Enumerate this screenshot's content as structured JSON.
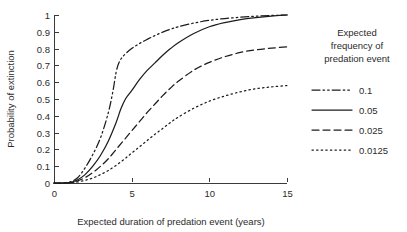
{
  "chart_data": {
    "type": "line",
    "title": "",
    "xlabel": "Expected duration of predation event (years)",
    "ylabel": "Probability of extinction",
    "xlim": [
      0,
      15
    ],
    "ylim": [
      0,
      1
    ],
    "xticks": [
      "0",
      "5",
      "10",
      "15"
    ],
    "xtick_values": [
      0,
      5,
      10,
      15
    ],
    "yticks": [
      "0",
      "0.1",
      "0.2",
      "0.3",
      "0.4",
      "0.5",
      "0.6",
      "0.7",
      "0.8",
      "0.9",
      "1"
    ],
    "ytick_values": [
      0,
      0.1,
      0.2,
      0.3,
      0.4,
      0.5,
      0.6,
      0.7,
      0.8,
      0.9,
      1
    ],
    "grid": false,
    "legend_position": "right",
    "legend_title": "Expected frequency of predation event",
    "series": [
      {
        "name": "0.1",
        "style": "dash-dot",
        "x": [
          0,
          0.5,
          1,
          1.5,
          2,
          2.5,
          3,
          3.5,
          3.8,
          4,
          4.2,
          4.5,
          5,
          5.5,
          6,
          6.5,
          7,
          7.5,
          8,
          9,
          10,
          11,
          12,
          13,
          14,
          15
        ],
        "y": [
          0,
          0,
          0.005,
          0.03,
          0.09,
          0.17,
          0.27,
          0.42,
          0.55,
          0.66,
          0.72,
          0.76,
          0.8,
          0.83,
          0.855,
          0.878,
          0.898,
          0.915,
          0.93,
          0.952,
          0.968,
          0.979,
          0.987,
          0.993,
          0.997,
          1.0
        ]
      },
      {
        "name": "0.05",
        "style": "solid",
        "x": [
          0,
          0.5,
          1,
          1.5,
          2,
          2.5,
          3,
          3.5,
          4,
          4.3,
          4.6,
          5,
          5.5,
          6,
          6.5,
          7,
          7.5,
          8,
          9,
          10,
          11,
          12,
          13,
          14,
          15
        ],
        "y": [
          0,
          0,
          0.003,
          0.018,
          0.05,
          0.1,
          0.165,
          0.25,
          0.36,
          0.44,
          0.5,
          0.55,
          0.615,
          0.67,
          0.715,
          0.76,
          0.8,
          0.835,
          0.89,
          0.93,
          0.955,
          0.973,
          0.985,
          0.994,
          1.0
        ]
      },
      {
        "name": "0.025",
        "style": "dashed",
        "x": [
          0,
          0.5,
          1,
          1.5,
          2,
          2.5,
          3,
          3.5,
          4,
          4.5,
          5,
          5.5,
          6,
          6.5,
          7,
          7.5,
          8,
          9,
          10,
          11,
          12,
          13,
          14,
          15
        ],
        "y": [
          0,
          0,
          0.002,
          0.012,
          0.032,
          0.062,
          0.1,
          0.145,
          0.2,
          0.255,
          0.31,
          0.365,
          0.42,
          0.47,
          0.52,
          0.565,
          0.605,
          0.672,
          0.718,
          0.752,
          0.777,
          0.793,
          0.803,
          0.81
        ]
      },
      {
        "name": "0.0125",
        "style": "dotted",
        "x": [
          0,
          0.5,
          1,
          1.5,
          2,
          2.5,
          3,
          3.5,
          4,
          4.5,
          5,
          5.5,
          6,
          6.5,
          7,
          7.5,
          8,
          9,
          10,
          11,
          12,
          13,
          14,
          15
        ],
        "y": [
          0,
          0,
          0.001,
          0.006,
          0.016,
          0.03,
          0.05,
          0.075,
          0.105,
          0.14,
          0.178,
          0.215,
          0.253,
          0.29,
          0.325,
          0.36,
          0.392,
          0.445,
          0.487,
          0.518,
          0.543,
          0.561,
          0.572,
          0.58
        ]
      }
    ]
  },
  "legend": {
    "title_lines": [
      "Expected",
      "frequency of",
      "predation event"
    ],
    "entries": [
      {
        "label": "0.1",
        "style": "dash-dot"
      },
      {
        "label": "0.05",
        "style": "solid"
      },
      {
        "label": "0.025",
        "style": "dashed"
      },
      {
        "label": "0.0125",
        "style": "dotted"
      }
    ]
  }
}
